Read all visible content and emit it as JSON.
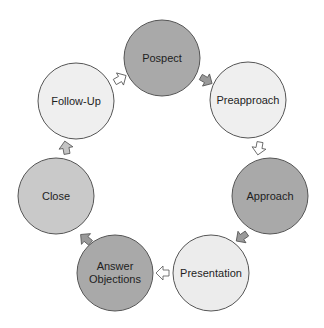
{
  "diagram": {
    "type": "cycle",
    "title": "",
    "nodes": [
      {
        "id": "pospect",
        "label": "Pospect",
        "cx": 162,
        "cy": 58,
        "r": 38,
        "fill": "#a9a9a9"
      },
      {
        "id": "preapproach",
        "label": "Preapproach",
        "cx": 248,
        "cy": 100,
        "r": 38,
        "fill": "#efefef"
      },
      {
        "id": "approach",
        "label": "Approach",
        "cx": 270,
        "cy": 196,
        "r": 38,
        "fill": "#a9a9a9"
      },
      {
        "id": "presentation",
        "label": "Presentation",
        "cx": 211,
        "cy": 273,
        "r": 38,
        "fill": "#ececec"
      },
      {
        "id": "answer-objections",
        "label": "Answer\nObjections",
        "cx": 115,
        "cy": 273,
        "r": 38,
        "fill": "#a9a9a9"
      },
      {
        "id": "close",
        "label": "Close",
        "cx": 56,
        "cy": 196,
        "r": 38,
        "fill": "#c9c9c9"
      },
      {
        "id": "follow-up",
        "label": "Follow-Up",
        "cx": 76,
        "cy": 101,
        "r": 38,
        "fill": "#efefef"
      }
    ],
    "edges": [
      {
        "from": "pospect",
        "to": "preapproach",
        "x": 206,
        "y": 80,
        "angle": 30,
        "fill": "#9a9a9a"
      },
      {
        "from": "preapproach",
        "to": "approach",
        "x": 259,
        "y": 148,
        "angle": 100,
        "fill": "#ffffff"
      },
      {
        "from": "approach",
        "to": "presentation",
        "x": 242,
        "y": 237,
        "angle": 145,
        "fill": "#9a9a9a"
      },
      {
        "from": "presentation",
        "to": "answer-objections",
        "x": 163,
        "y": 273,
        "angle": 180,
        "fill": "#ffffff"
      },
      {
        "from": "answer-objections",
        "to": "close",
        "x": 86,
        "y": 239,
        "angle": 220,
        "fill": "#9a9a9a"
      },
      {
        "from": "close",
        "to": "follow-up",
        "x": 66,
        "y": 148,
        "angle": 260,
        "fill": "#c4c4c4"
      },
      {
        "from": "follow-up",
        "to": "pospect",
        "x": 120,
        "y": 79,
        "angle": 330,
        "fill": "#ffffff"
      }
    ],
    "colors": {
      "stroke": "#555555",
      "dark": "#a9a9a9",
      "medium": "#c9c9c9",
      "light": "#efefef",
      "text": "#1e1e1e"
    }
  }
}
